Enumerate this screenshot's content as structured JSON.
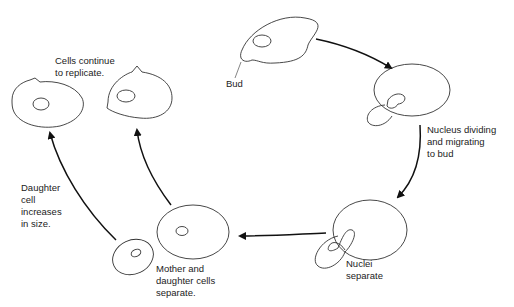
{
  "diagram": {
    "colors": {
      "line": "#333333",
      "arrow": "#111111",
      "text": "#222222",
      "background": "#ffffff"
    },
    "stages": [
      {
        "id": "bud",
        "label": "Bud"
      },
      {
        "id": "nucleus-dividing",
        "label": "Nucleus dividing\nand migrating\nto bud"
      },
      {
        "id": "nuclei-separate",
        "label": "Nuclei\nseparate"
      },
      {
        "id": "cells-separate",
        "label": "Mother and\ndaughter cells\nseparate."
      },
      {
        "id": "daughter-grows",
        "label": "Daughter\ncell\nincreases\nin size."
      },
      {
        "id": "replicate",
        "label": "Cells continue\nto replicate."
      }
    ],
    "arrows": [
      {
        "from": "bud",
        "to": "nucleus-dividing"
      },
      {
        "from": "nucleus-dividing",
        "to": "nuclei-separate"
      },
      {
        "from": "nuclei-separate",
        "to": "cells-separate"
      },
      {
        "from": "cells-separate",
        "to": "replicate"
      },
      {
        "from": "daughter-grows",
        "to": "replicate"
      }
    ]
  }
}
